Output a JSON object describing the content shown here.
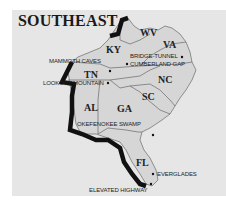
{
  "map": {
    "title": "SOUTHEAST",
    "colors": {
      "background": "#e6e6e6",
      "land": "#d8d8d8",
      "border": "#555555",
      "route": "#111111"
    },
    "states": [
      {
        "abbr": "KY"
      },
      {
        "abbr": "WV"
      },
      {
        "abbr": "VA"
      },
      {
        "abbr": "TN"
      },
      {
        "abbr": "NC"
      },
      {
        "abbr": "SC"
      },
      {
        "abbr": "AL"
      },
      {
        "abbr": "GA"
      },
      {
        "abbr": "FL"
      }
    ],
    "places": [
      {
        "name": "MAMMOTH CAVES"
      },
      {
        "name": "BRIDGE-TUNNEL"
      },
      {
        "name": "CUMBERLAND GAP"
      },
      {
        "name": "LOOKOUT MOUNTAIN"
      },
      {
        "name": "OKEFENOKEE SWAMP"
      },
      {
        "name": "EVERGLADES"
      },
      {
        "name": "ELEVATED HIGHWAY"
      }
    ]
  }
}
